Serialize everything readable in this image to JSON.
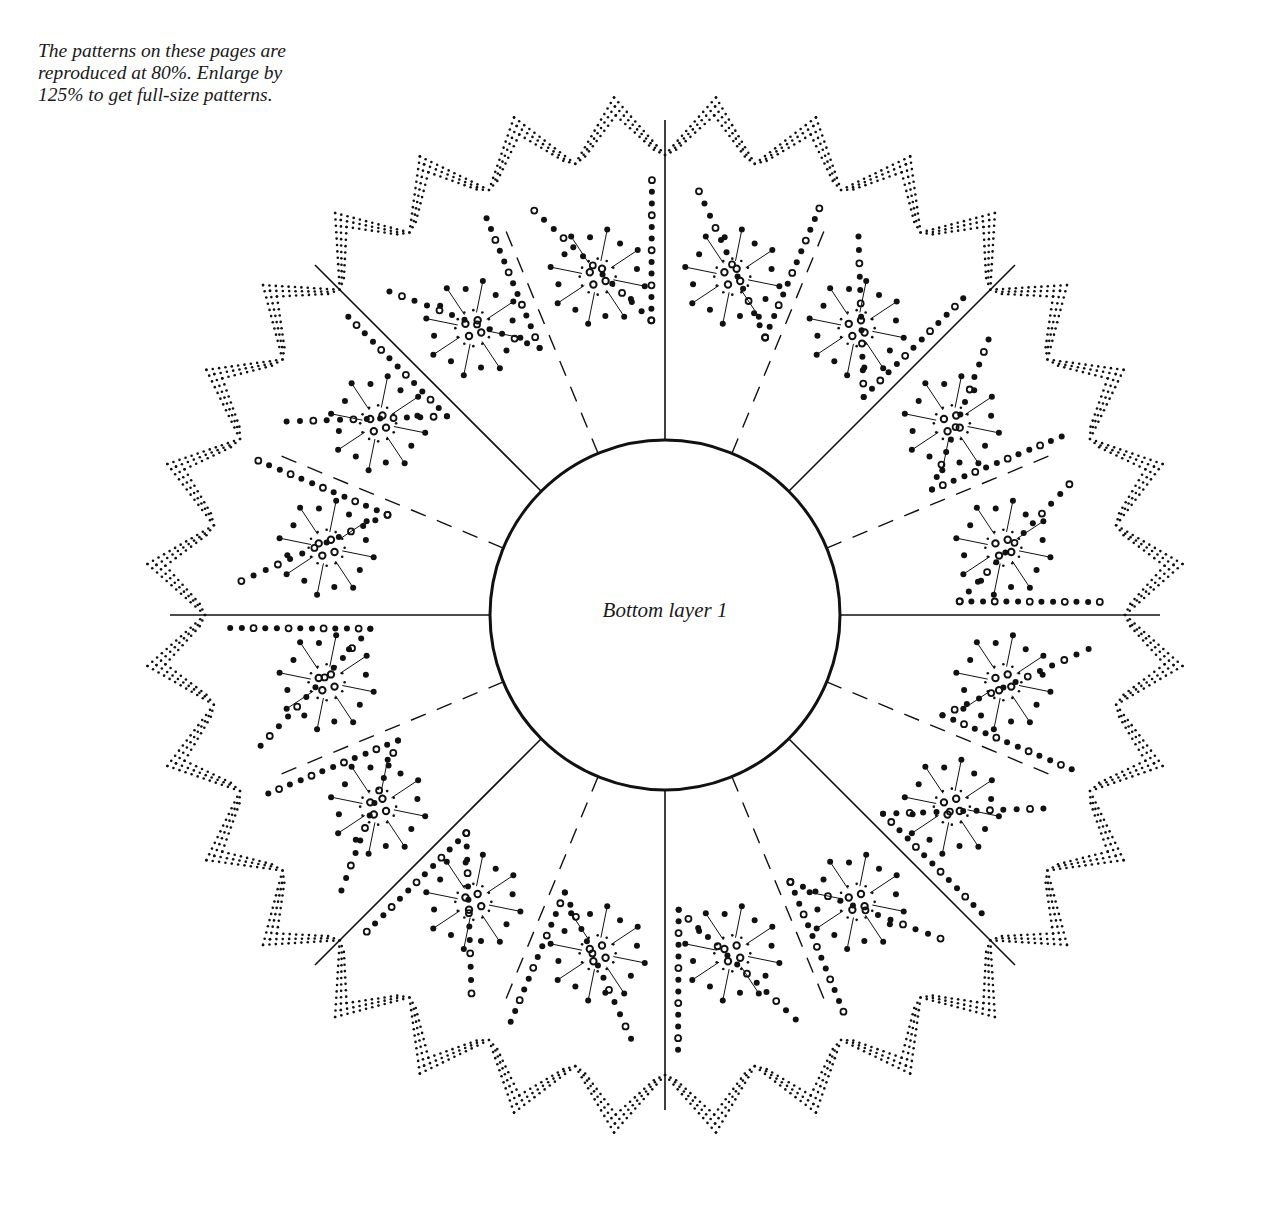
{
  "note": {
    "lines": [
      "The patterns on these pages are",
      "reproduced at 80%. Enlarge by",
      "125% to get full-size patterns."
    ]
  },
  "diagram": {
    "center_label": "Bottom layer 1",
    "center": [
      665,
      615
    ],
    "inner_radius": 175,
    "outer_radius": 505,
    "segments": 16,
    "solid_line_count": 8,
    "dashed_line_count": 8,
    "border_points": 32,
    "ink_color": "#111111"
  }
}
